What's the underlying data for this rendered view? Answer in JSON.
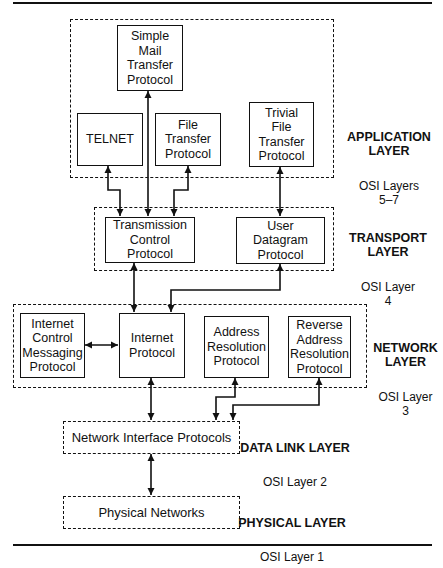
{
  "diagram": {
    "layers": [
      {
        "id": "application",
        "title": "APPLICATION\nLAYER",
        "osi": "OSI Layers\n5–7"
      },
      {
        "id": "transport",
        "title": "TRANSPORT\nLAYER",
        "osi": "OSI Layer\n4"
      },
      {
        "id": "network",
        "title": "NETWORK\nLAYER",
        "osi": "OSI Layer\n3"
      },
      {
        "id": "datalink",
        "title": "DATA LINK LAYER",
        "osi": "OSI Layer 2"
      },
      {
        "id": "physical",
        "title": "PHYSICAL LAYER",
        "osi": "OSI Layer 1"
      }
    ],
    "nodes": {
      "smtp": "Simple\nMail\nTransfer\nProtocol",
      "telnet": "TELNET",
      "ftp": "File\nTransfer\nProtocol",
      "tftp": "Trivial\nFile\nTransfer\nProtocol",
      "tcp": "Transmission\nControl\nProtocol",
      "udp": "User\nDatagram\nProtocol",
      "icmp": "Internet\nControl\nMessaging\nProtocol",
      "ip": "Internet\nProtocol",
      "arp": "Address\nResolution\nProtocol",
      "rarp": "Reverse\nAddress\nResolution\nProtocol",
      "nip": "Network Interface Protocols",
      "phys": "Physical Networks"
    },
    "edges": [
      {
        "from": "telnet",
        "to": "tcp",
        "type": "bidirectional"
      },
      {
        "from": "smtp",
        "to": "tcp",
        "type": "bidirectional"
      },
      {
        "from": "ftp",
        "to": "tcp",
        "type": "bidirectional"
      },
      {
        "from": "tftp",
        "to": "udp",
        "type": "bidirectional"
      },
      {
        "from": "tcp",
        "to": "ip",
        "type": "bidirectional"
      },
      {
        "from": "udp",
        "to": "ip",
        "type": "bidirectional"
      },
      {
        "from": "icmp",
        "to": "ip",
        "type": "bidirectional"
      },
      {
        "from": "ip",
        "to": "nip",
        "type": "bidirectional"
      },
      {
        "from": "arp",
        "to": "nip",
        "type": "bidirectional"
      },
      {
        "from": "rarp",
        "to": "nip",
        "type": "bidirectional"
      },
      {
        "from": "nip",
        "to": "phys",
        "type": "bidirectional"
      }
    ]
  }
}
